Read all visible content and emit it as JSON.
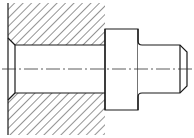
{
  "drawing": {
    "type": "mechanical section view",
    "subject": "stepped shaft inserted into bored housing",
    "colors": {
      "background": "#ffffff",
      "line": "#1a1a1a",
      "hatch": "#2a2a2a",
      "centerline": "#333333"
    },
    "housing": {
      "left_x": 8,
      "right_x": 105,
      "top_y": 3,
      "bottom_y": 135,
      "bore_top_y": 45,
      "bore_bottom_y": 93,
      "entry_chamfer": 7,
      "hatch_spacing": 6,
      "hatch_angle_deg": 45
    },
    "shaft": {
      "collar": {
        "x1": 105,
        "x2": 138,
        "top_y": 29,
        "bottom_y": 110
      },
      "pin": {
        "x1": 138,
        "x2": 187,
        "top_y": 45,
        "bottom_y": 93,
        "chamfer": 7,
        "fillet": 4
      }
    },
    "centerline": {
      "y": 69,
      "x1": 2,
      "x2": 192,
      "dash_pattern": "14 3 2 3"
    }
  }
}
